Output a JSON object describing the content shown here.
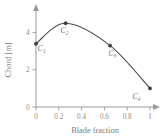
{
  "chart_data": {
    "type": "line",
    "title": "",
    "xlabel": "Blade fraction",
    "ylabel": "Chord [m]",
    "xlim": [
      0,
      1
    ],
    "ylim": [
      0,
      5
    ],
    "grid": false,
    "legend": "none",
    "x_ticks": [
      "0",
      "0.2",
      "0.4",
      "0.6",
      "0.8",
      "1"
    ],
    "x_tick_values": [
      0,
      0.2,
      0.4,
      0.6,
      0.8,
      1
    ],
    "y_ticks": [
      "0",
      "2",
      "4"
    ],
    "y_tick_values": [
      0,
      2,
      4
    ],
    "series": [
      {
        "name": "chord distribution",
        "x": [
          0,
          0.26,
          0.65,
          1
        ],
        "values": [
          3.4,
          4.5,
          3.3,
          1.0
        ],
        "point_labels": [
          "C1",
          "C2",
          "C3",
          "C4"
        ]
      }
    ],
    "annotations": [
      {
        "text": "C",
        "subscript": "1",
        "x": 0.05,
        "y": 3.0
      },
      {
        "text": "C",
        "subscript": "2",
        "x": 0.25,
        "y": 4.0
      },
      {
        "text": "C",
        "subscript": "3",
        "x": 0.67,
        "y": 2.75
      },
      {
        "text": "C",
        "subscript": "4",
        "x": 0.88,
        "y": 0.45
      }
    ],
    "colors": {
      "curve": "#4a4a4a",
      "marker": "#3d3d3d",
      "axis": "#9a9a9a",
      "tick_text": "#8c8c8c",
      "axis_title": "#7d7d7d",
      "label": "#6f6f6f",
      "background": "#ffffff"
    }
  }
}
